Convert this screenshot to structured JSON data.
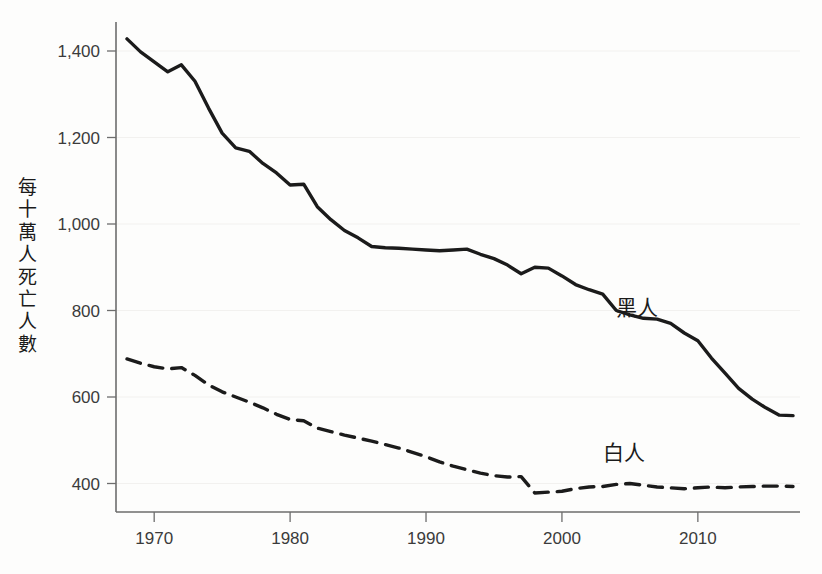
{
  "chart_data": {
    "type": "line",
    "title": "",
    "xlabel": "",
    "ylabel": "每十萬人死亡人數",
    "xlim": [
      1968,
      2017
    ],
    "ylim": [
      330,
      1450
    ],
    "grid": false,
    "legend_position": "inline-right",
    "x_ticks": [
      "1970",
      "1980",
      "1990",
      "2000",
      "2010"
    ],
    "x_tick_values": [
      1970,
      1980,
      1990,
      2000,
      2010
    ],
    "y_ticks": [
      "400",
      "600",
      "800",
      "1,000",
      "1,200",
      "1,400"
    ],
    "y_tick_values": [
      400,
      600,
      800,
      1000,
      1200,
      1400
    ],
    "x": [
      1968,
      1969,
      1970,
      1971,
      1972,
      1973,
      1974,
      1975,
      1976,
      1977,
      1978,
      1979,
      1980,
      1981,
      1982,
      1983,
      1984,
      1985,
      1986,
      1987,
      1988,
      1989,
      1990,
      1991,
      1992,
      1993,
      1994,
      1995,
      1996,
      1997,
      1998,
      1999,
      2000,
      2001,
      2002,
      2003,
      2004,
      2005,
      2006,
      2007,
      2008,
      2009,
      2010,
      2011,
      2012,
      2013,
      2014,
      2015,
      2016,
      2017
    ],
    "series": [
      {
        "name": "黑人",
        "style": "solid",
        "color": "#1b1b1b",
        "label_x": 2004,
        "label_y": 790,
        "values": [
          1428,
          1398,
          1375,
          1352,
          1368,
          1330,
          1268,
          1210,
          1176,
          1168,
          1140,
          1118,
          1090,
          1092,
          1040,
          1010,
          985,
          968,
          948,
          945,
          944,
          942,
          940,
          938,
          940,
          942,
          930,
          920,
          905,
          885,
          900,
          898,
          880,
          860,
          848,
          838,
          800,
          790,
          782,
          780,
          770,
          748,
          730,
          690,
          655,
          620,
          595,
          575,
          558,
          557
        ]
      },
      {
        "name": "白人",
        "style": "dashed",
        "color": "#1b1b1b",
        "label_x": 2003,
        "label_y": 455,
        "values": [
          688,
          678,
          670,
          665,
          668,
          650,
          628,
          612,
          600,
          588,
          575,
          560,
          548,
          545,
          528,
          520,
          512,
          505,
          498,
          490,
          482,
          472,
          462,
          450,
          440,
          432,
          424,
          418,
          415,
          416,
          378,
          380,
          382,
          388,
          392,
          393,
          398,
          400,
          396,
          392,
          390,
          388,
          390,
          392,
          390,
          392,
          393,
          394,
          394,
          393
        ]
      }
    ]
  },
  "axis": {
    "y_title": "每十萬人死亡人數"
  }
}
